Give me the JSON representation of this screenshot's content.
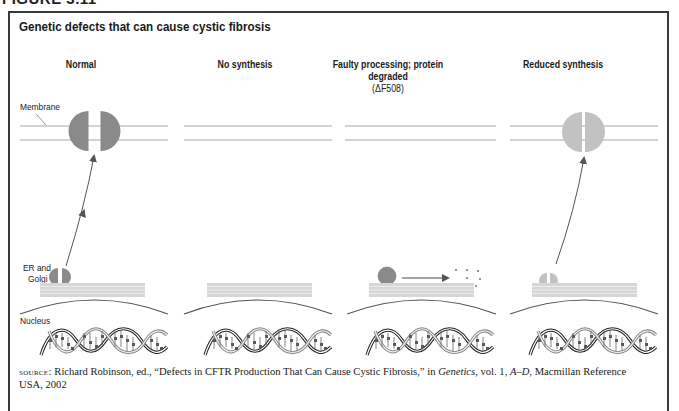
{
  "figure": {
    "label": "FIGURE 3.11",
    "title": "Genetic defects that can cause cystic fibrosis"
  },
  "columns": [
    {
      "heading": "Normal",
      "subheading": "",
      "protein_state": "full-split",
      "color": "#8a8a8a"
    },
    {
      "heading": "No synthesis",
      "subheading": "",
      "protein_state": "none",
      "color": ""
    },
    {
      "heading": "Faulty processing; protein degraded",
      "subheading": "(ΔF508)",
      "protein_state": "degraded",
      "color": "#8a8a8a"
    },
    {
      "heading": "Reduced synthesis",
      "subheading": "",
      "protein_state": "reduced-split",
      "color": "#c2c2c2"
    }
  ],
  "labels": {
    "membrane": "Membrane",
    "er_golgi_line1": "ER and",
    "er_golgi_line2": "Golgi",
    "nucleus": "Nucleus"
  },
  "source": {
    "prefix": "source:",
    "text_1": " Richard Robinson, ed., “Defects in CFTR Production That Can Cause Cystic Fibrosis,” in ",
    "italic_1": "Genetics",
    "text_2": ", vol. 1, ",
    "italic_2": "A–D",
    "text_3": ", Macmillan Reference USA, 2002"
  },
  "colors": {
    "frame": "#3a3a3a",
    "membrane_line": "#a8a8a8",
    "protein_dark": "#8a8a8a",
    "protein_light": "#c2c2c2",
    "er_band": "#cfcfcf",
    "nucleus_arc": "#555555",
    "arrow": "#555555"
  }
}
